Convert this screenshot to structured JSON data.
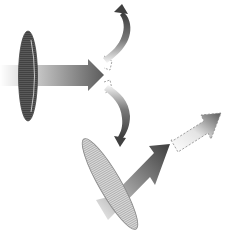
{
  "diagram": {
    "elements": {
      "top_disc": {
        "description": "Vertical disc (dark, hatched)",
        "fill": "#5a5a5a"
      },
      "top_arrow": {
        "description": "Horizontal beam arrow through vertical disc",
        "gradient": [
          "#f2f2f2",
          "#5e5e5e"
        ]
      },
      "top_dashed_end": {
        "description": "Dashed continuation box"
      },
      "curved_arrow_up": {
        "description": "Curved rotation arrow pointing up"
      },
      "curved_arrow_down": {
        "description": "Curved rotation arrow pointing down"
      },
      "bottom_disc": {
        "description": "Tilted disc (light, hatched)",
        "fill": "#cfcfcf"
      },
      "bottom_arrow": {
        "description": "Diagonal beam arrow through tilted disc",
        "gradient": [
          "#f2f2f2",
          "#4a4a4a"
        ]
      },
      "bottom_dashed_arrow": {
        "description": "Dashed diagonal arrow continuation",
        "gradient": [
          "#ffffff",
          "#6a6a6a"
        ]
      }
    },
    "colors": {
      "background": "#ffffff",
      "dark_disc": "#555555",
      "light_disc": "#d0d0d0",
      "arrow_dark": "#4e4e4e",
      "arrow_light": "#f0f0f0",
      "dash_stroke": "#9a9a9a"
    }
  }
}
